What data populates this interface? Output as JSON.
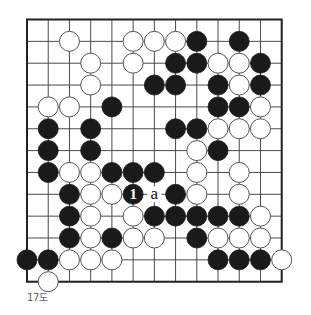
{
  "diagram": {
    "type": "go-board",
    "caption": "17도",
    "grid": {
      "columns": 13,
      "rows": 13
    },
    "colors": {
      "background": "#ffffff",
      "line": "#4a4a4a",
      "border": "#222222",
      "black_stone": "#1a1a1a",
      "white_stone_fill": "#ffffff",
      "white_stone_stroke": "#555555",
      "caption": "#666666"
    },
    "stones": [
      {
        "color": "white",
        "col": 2,
        "row": 1
      },
      {
        "color": "white",
        "col": 5,
        "row": 1
      },
      {
        "color": "white",
        "col": 6,
        "row": 1
      },
      {
        "color": "white",
        "col": 7,
        "row": 1
      },
      {
        "color": "black",
        "col": 8,
        "row": 1
      },
      {
        "color": "black",
        "col": 10,
        "row": 1
      },
      {
        "color": "white",
        "col": 3,
        "row": 2
      },
      {
        "color": "white",
        "col": 5,
        "row": 2
      },
      {
        "color": "black",
        "col": 7,
        "row": 2
      },
      {
        "color": "black",
        "col": 8,
        "row": 2
      },
      {
        "color": "white",
        "col": 9,
        "row": 2
      },
      {
        "color": "white",
        "col": 10,
        "row": 2
      },
      {
        "color": "black",
        "col": 11,
        "row": 2
      },
      {
        "color": "white",
        "col": 3,
        "row": 3
      },
      {
        "color": "black",
        "col": 6,
        "row": 3
      },
      {
        "color": "black",
        "col": 7,
        "row": 3
      },
      {
        "color": "black",
        "col": 9,
        "row": 3
      },
      {
        "color": "white",
        "col": 10,
        "row": 3
      },
      {
        "color": "black",
        "col": 11,
        "row": 3
      },
      {
        "color": "white",
        "col": 1,
        "row": 4
      },
      {
        "color": "white",
        "col": 2,
        "row": 4
      },
      {
        "color": "black",
        "col": 4,
        "row": 4
      },
      {
        "color": "black",
        "col": 9,
        "row": 4
      },
      {
        "color": "black",
        "col": 10,
        "row": 4
      },
      {
        "color": "white",
        "col": 11,
        "row": 4
      },
      {
        "color": "black",
        "col": 1,
        "row": 5
      },
      {
        "color": "black",
        "col": 3,
        "row": 5
      },
      {
        "color": "black",
        "col": 7,
        "row": 5
      },
      {
        "color": "black",
        "col": 8,
        "row": 5
      },
      {
        "color": "white",
        "col": 9,
        "row": 5
      },
      {
        "color": "white",
        "col": 10,
        "row": 5
      },
      {
        "color": "white",
        "col": 11,
        "row": 5
      },
      {
        "color": "black",
        "col": 1,
        "row": 6
      },
      {
        "color": "black",
        "col": 3,
        "row": 6
      },
      {
        "color": "white",
        "col": 8,
        "row": 6
      },
      {
        "color": "black",
        "col": 9,
        "row": 6
      },
      {
        "color": "black",
        "col": 1,
        "row": 7
      },
      {
        "color": "white",
        "col": 2,
        "row": 7
      },
      {
        "color": "white",
        "col": 3,
        "row": 7
      },
      {
        "color": "black",
        "col": 4,
        "row": 7
      },
      {
        "color": "black",
        "col": 5,
        "row": 7
      },
      {
        "color": "black",
        "col": 6,
        "row": 7
      },
      {
        "color": "white",
        "col": 8,
        "row": 7
      },
      {
        "color": "white",
        "col": 10,
        "row": 7
      },
      {
        "color": "black",
        "col": 2,
        "row": 8
      },
      {
        "color": "white",
        "col": 3,
        "row": 8
      },
      {
        "color": "white",
        "col": 4,
        "row": 8
      },
      {
        "color": "black",
        "col": 5,
        "row": 8,
        "label": "1"
      },
      {
        "color": "black",
        "col": 7,
        "row": 8
      },
      {
        "color": "white",
        "col": 8,
        "row": 8
      },
      {
        "color": "white",
        "col": 10,
        "row": 8
      },
      {
        "color": "black",
        "col": 2,
        "row": 9
      },
      {
        "color": "white",
        "col": 3,
        "row": 9
      },
      {
        "color": "white",
        "col": 5,
        "row": 9
      },
      {
        "color": "black",
        "col": 6,
        "row": 9
      },
      {
        "color": "black",
        "col": 7,
        "row": 9
      },
      {
        "color": "black",
        "col": 8,
        "row": 9
      },
      {
        "color": "black",
        "col": 9,
        "row": 9
      },
      {
        "color": "black",
        "col": 10,
        "row": 9
      },
      {
        "color": "white",
        "col": 11,
        "row": 9
      },
      {
        "color": "black",
        "col": 2,
        "row": 10
      },
      {
        "color": "white",
        "col": 3,
        "row": 10
      },
      {
        "color": "black",
        "col": 4,
        "row": 10
      },
      {
        "color": "white",
        "col": 5,
        "row": 10
      },
      {
        "color": "white",
        "col": 6,
        "row": 10
      },
      {
        "color": "black",
        "col": 8,
        "row": 10
      },
      {
        "color": "white",
        "col": 9,
        "row": 10
      },
      {
        "color": "white",
        "col": 10,
        "row": 10
      },
      {
        "color": "white",
        "col": 11,
        "row": 10
      },
      {
        "color": "black",
        "col": 0,
        "row": 11
      },
      {
        "color": "black",
        "col": 1,
        "row": 11
      },
      {
        "color": "white",
        "col": 2,
        "row": 11
      },
      {
        "color": "white",
        "col": 3,
        "row": 11
      },
      {
        "color": "white",
        "col": 4,
        "row": 11
      },
      {
        "color": "black",
        "col": 9,
        "row": 11
      },
      {
        "color": "black",
        "col": 10,
        "row": 11
      },
      {
        "color": "black",
        "col": 11,
        "row": 11
      },
      {
        "color": "white",
        "col": 12,
        "row": 11
      },
      {
        "color": "white",
        "col": 1,
        "row": 12
      }
    ],
    "markers": [
      {
        "text": "a",
        "col": 6,
        "row": 8
      }
    ]
  }
}
